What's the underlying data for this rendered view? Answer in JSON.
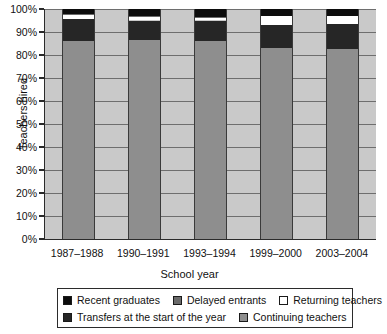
{
  "chart_data": {
    "type": "bar",
    "subtype": "stacked-bar-100-percent",
    "title": "",
    "xlabel": "School year",
    "ylabel": "Teachers hired",
    "ylim": [
      0,
      100
    ],
    "ytick_labels": [
      "0%",
      "10%",
      "20%",
      "30%",
      "40%",
      "50%",
      "60%",
      "70%",
      "80%",
      "90%",
      "100%"
    ],
    "ytick_values": [
      0,
      10,
      20,
      30,
      40,
      50,
      60,
      70,
      80,
      90,
      100
    ],
    "grid": true,
    "grid_axis": "y",
    "legend_position": "bottom",
    "categories": [
      "1987–1988",
      "1990–1991",
      "1993–1994",
      "1999–2000",
      "2003–2004"
    ],
    "stack_order_bottom_to_top": [
      "Continuing teachers",
      "Transfers at the start of the year",
      "Returning teachers",
      "Delayed entrants",
      "Recent graduates"
    ],
    "series": [
      {
        "name": "Continuing teachers",
        "color": "#8e8e8e",
        "values": [
          86.0,
          86.5,
          86.0,
          83.0,
          82.5
        ]
      },
      {
        "name": "Transfers at the start of the year",
        "color": "#262626",
        "values": [
          9.5,
          8.5,
          9.0,
          10.0,
          11.0
        ]
      },
      {
        "name": "Returning teachers",
        "color": "#ffffff",
        "values": [
          2.0,
          1.5,
          1.0,
          4.0,
          3.5
        ]
      },
      {
        "name": "Delayed entrants",
        "color": "#6a6a6a",
        "values": [
          0.5,
          0.5,
          0.5,
          0.0,
          0.0
        ]
      },
      {
        "name": "Recent graduates",
        "color": "#0c0c0c",
        "values": [
          2.0,
          3.0,
          3.5,
          3.0,
          3.0
        ]
      }
    ]
  },
  "axes": {
    "y_title": "Teachers hired",
    "x_title": "School year"
  },
  "legend": {
    "row1": [
      {
        "label": "Recent graduates",
        "color": "#0c0c0c"
      },
      {
        "label": "Delayed entrants",
        "color": "#6a6a6a"
      },
      {
        "label": "Returning teachers",
        "color": "#ffffff"
      }
    ],
    "row2": [
      {
        "label": "Transfers at the start of the year",
        "color": "#262626"
      },
      {
        "label": "Continuing teachers",
        "color": "#8e8e8e"
      }
    ]
  }
}
